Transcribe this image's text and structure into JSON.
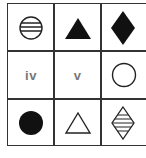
{
  "puzzle": {
    "rows": 3,
    "cols": 3,
    "cells": [
      {
        "row": 0,
        "col": 0,
        "shape": "circle",
        "fill": "horizontal-stripes",
        "label": ""
      },
      {
        "row": 0,
        "col": 1,
        "shape": "triangle",
        "fill": "solid-black",
        "label": ""
      },
      {
        "row": 0,
        "col": 2,
        "shape": "diamond",
        "fill": "solid-black",
        "label": ""
      },
      {
        "row": 1,
        "col": 0,
        "shape": "none",
        "fill": "none",
        "label": "iv"
      },
      {
        "row": 1,
        "col": 1,
        "shape": "none",
        "fill": "none",
        "label": "v"
      },
      {
        "row": 1,
        "col": 2,
        "shape": "circle",
        "fill": "outline",
        "label": ""
      },
      {
        "row": 2,
        "col": 0,
        "shape": "circle",
        "fill": "solid-black",
        "label": ""
      },
      {
        "row": 2,
        "col": 1,
        "shape": "triangle",
        "fill": "outline",
        "label": ""
      },
      {
        "row": 2,
        "col": 2,
        "shape": "diamond",
        "fill": "horizontal-stripes",
        "label": ""
      }
    ],
    "colors": {
      "stroke": "#222222",
      "line": "#333333",
      "label": "#777777",
      "background": "#ffffff"
    }
  }
}
